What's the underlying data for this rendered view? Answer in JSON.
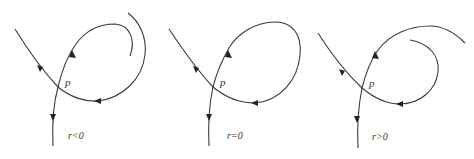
{
  "diagram": {
    "type": "phase-portrait-bifurcation",
    "panels": [
      {
        "id": "panel-1",
        "point_label": "p",
        "condition_label": "r<0",
        "description": "unstable manifold spirals inside stable manifold"
      },
      {
        "id": "panel-2",
        "point_label": "p",
        "condition_label": "r=0",
        "description": "homoclinic loop"
      },
      {
        "id": "panel-3",
        "point_label": "p",
        "condition_label": "r>0",
        "description": "unstable manifold spirals outside stable manifold"
      }
    ],
    "colors": {
      "stroke": "#3a3a3a",
      "arrow": "#222222",
      "background": "#ffffff"
    }
  }
}
